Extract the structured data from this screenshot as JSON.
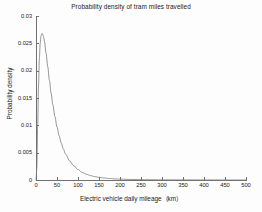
{
  "chart_data": {
    "type": "line",
    "title": "Probability density of tram miles travelled",
    "xlabel": "Electric vehicle daily mileage（km）",
    "ylabel": "Probability density",
    "xlim": [
      0,
      500
    ],
    "ylim": [
      0,
      0.03
    ],
    "grid": false,
    "legend": null,
    "line_color": "#7a7a7a",
    "distribution": "lognormal",
    "peak": {
      "x": 15,
      "y": 0.0268
    },
    "xticks": [
      0,
      50,
      100,
      150,
      200,
      250,
      300,
      350,
      400,
      450,
      500
    ],
    "xtick_labels": [
      "0",
      "50",
      "100",
      "150",
      "200",
      "250",
      "300",
      "350",
      "400",
      "450",
      "500"
    ],
    "yticks": [
      0,
      0.005,
      0.01,
      0.015,
      0.02,
      0.025,
      0.03
    ],
    "ytick_labels": [
      "0",
      "0.005",
      "0.01",
      "0.015",
      "0.02",
      "0.025",
      "0.03"
    ],
    "series": [
      {
        "name": "Probability density",
        "x": [
          0,
          2,
          4,
          6,
          8,
          10,
          12,
          14,
          15,
          16,
          18,
          20,
          24,
          28,
          32,
          36,
          40,
          45,
          50,
          55,
          60,
          65,
          70,
          80,
          90,
          100,
          110,
          120,
          130,
          140,
          150,
          160,
          175,
          190,
          200,
          225,
          250,
          275,
          300,
          350,
          400,
          450,
          500
        ],
        "y": [
          0.0,
          0.0022,
          0.0098,
          0.0172,
          0.0222,
          0.025,
          0.0264,
          0.0268,
          0.0268,
          0.02665,
          0.0262,
          0.0254,
          0.0232,
          0.0207,
          0.0182,
          0.0159,
          0.0138,
          0.0116,
          0.0097,
          0.0081,
          0.0068,
          0.0057,
          0.0048,
          0.0035,
          0.0026,
          0.0019,
          0.0014,
          0.00105,
          0.0008,
          0.00062,
          0.00048,
          0.00038,
          0.00027,
          0.0002,
          0.00016,
          0.0001,
          7e-05,
          5e-05,
          3e-05,
          2e-05,
          1e-05,
          5e-06,
          2e-06
        ]
      }
    ]
  }
}
